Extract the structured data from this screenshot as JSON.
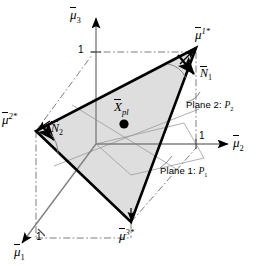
{
  "figure": {
    "type": "geometry-diagram",
    "background_color": "#ffffff",
    "line_color": "#000000",
    "fill_color": "#dcdcdc",
    "grid_color": "#909090"
  },
  "axes": [
    {
      "id": "mu1",
      "base": "μ",
      "sub": "1",
      "label": "μ̅₁",
      "tick_label": "1",
      "direction": "lower-left"
    },
    {
      "id": "mu2",
      "base": "μ",
      "sub": "2",
      "label": "μ̅₂",
      "tick_label": "1",
      "direction": "right"
    },
    {
      "id": "mu3",
      "base": "μ",
      "sub": "3",
      "label": "μ̅₃",
      "tick_label": "1",
      "direction": "up"
    }
  ],
  "vertices": [
    {
      "id": "v1",
      "base": "μ",
      "sup": "1*",
      "label": "μ̅^{1*}",
      "position": "top-right"
    },
    {
      "id": "v2",
      "base": "μ",
      "sup": "2*",
      "label": "μ̅^{2*}",
      "position": "left"
    },
    {
      "id": "v3",
      "base": "μ",
      "sup": "3*",
      "label": "μ̅^{3*}",
      "position": "bottom"
    }
  ],
  "center_point": {
    "base": "X",
    "sub": "pl",
    "label": "X̅_{pl}"
  },
  "normals": [
    {
      "id": "n1",
      "base": "N",
      "sub": "1",
      "label": "N̅₁"
    },
    {
      "id": "n2",
      "base": "N",
      "sub": "2",
      "label": "N̅₂"
    }
  ],
  "plane_labels": [
    {
      "id": "plane1",
      "text": "Plane 1: ",
      "symbol": "P",
      "sub": "1"
    },
    {
      "id": "plane2",
      "text": "Plane 2: ",
      "symbol": "P",
      "sub": "2"
    }
  ],
  "ticks": {
    "mu1": "1",
    "mu2": "1",
    "mu3": "1"
  }
}
